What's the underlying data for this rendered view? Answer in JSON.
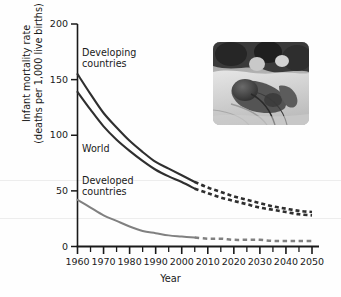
{
  "figure": {
    "kind": "line-chart-with-inset-photo",
    "inset_photo_alt": "newborn infant receiving neonatal care with tubing"
  },
  "chart_data": {
    "type": "line",
    "title": "",
    "xlabel": "Year",
    "ylabel": "Infant mortality rate (deaths per 1,000 live births)",
    "ylabel_line1": "Infant mortality rate",
    "ylabel_line2": "(deaths per 1,000 live births)",
    "xlim": [
      1960,
      2050
    ],
    "ylim": [
      0,
      200
    ],
    "yticks": [
      0,
      50,
      100,
      150,
      200
    ],
    "ytick_labels": [
      "0",
      "50",
      "100",
      "150",
      "200"
    ],
    "xticks": [
      1960,
      1970,
      1980,
      1990,
      2000,
      2010,
      2020,
      2030,
      2040,
      2050
    ],
    "xtick_labels": [
      "1960",
      "1970",
      "1980",
      "1990",
      "2000",
      "2010",
      "2020",
      "2030",
      "2040",
      "2050"
    ],
    "x_minor_tick_step": 5,
    "grid": false,
    "legend_position": "inline-annotations",
    "projection_starts_year": 2005,
    "series": [
      {
        "name": "Developing countries",
        "label": "Developing\ncountries",
        "label_line1": "Developing",
        "label_line2": "countries",
        "color": "#2f2f2f",
        "x": [
          1960,
          1965,
          1970,
          1975,
          1980,
          1985,
          1990,
          1995,
          2000,
          2005,
          2010,
          2015,
          2020,
          2025,
          2030,
          2035,
          2040,
          2045,
          2050
        ],
        "values": [
          155,
          137,
          120,
          107,
          95,
          85,
          76,
          70,
          64,
          58,
          53,
          49,
          45,
          42,
          39,
          36,
          34,
          32,
          31
        ],
        "solid_until": 2005,
        "dashed_from": 2005
      },
      {
        "name": "World",
        "label": "World",
        "color": "#2f2f2f",
        "x": [
          1960,
          1965,
          1970,
          1975,
          1980,
          1985,
          1990,
          1995,
          2000,
          2005,
          2010,
          2015,
          2020,
          2025,
          2030,
          2035,
          2040,
          2045,
          2050
        ],
        "values": [
          139,
          123,
          108,
          96,
          86,
          77,
          69,
          63,
          58,
          52,
          48,
          44,
          41,
          38,
          35,
          33,
          31,
          29,
          28
        ],
        "solid_until": 2005,
        "dashed_from": 2005
      },
      {
        "name": "Developed countries",
        "label": "Developed\ncountries",
        "label_line1": "Developed",
        "label_line2": "countries",
        "color": "#808080",
        "x": [
          1960,
          1965,
          1970,
          1975,
          1980,
          1985,
          1990,
          1995,
          2000,
          2005,
          2010,
          2015,
          2020,
          2025,
          2030,
          2035,
          2040,
          2045,
          2050
        ],
        "values": [
          42,
          35,
          28,
          23,
          18,
          14,
          12,
          10,
          9,
          8,
          7,
          7,
          6,
          6,
          6,
          5,
          5,
          5,
          5
        ],
        "solid_until": 2005,
        "dashed_from": 2005
      }
    ]
  },
  "colors": {
    "axis": "#1a1a1a",
    "dark_series": "#2f2f2f",
    "light_series": "#808080",
    "background": "#fefefe",
    "scan_line": "#ededed"
  }
}
